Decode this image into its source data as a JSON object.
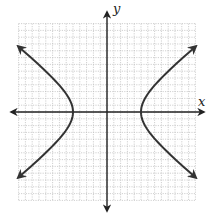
{
  "chart_data": {
    "type": "line",
    "title": "",
    "equation": "x^2/25 - y^2/16 = 1",
    "xlabel": "x",
    "ylabel": "y",
    "xlim": [
      -13,
      13
    ],
    "ylim": [
      -13,
      13
    ],
    "grid": true,
    "grid_style": "dotted light gray, 1 unit spacing",
    "tick_labels": false,
    "legend": null,
    "vertices": [
      [
        -5,
        0
      ],
      [
        5,
        0
      ]
    ],
    "series": [
      {
        "name": "right branch",
        "points": [
          [
            13,
            9.6
          ],
          [
            11,
            7.84
          ],
          [
            9,
            5.99
          ],
          [
            7,
            3.92
          ],
          [
            6,
            2.65
          ],
          [
            5.5,
            1.83
          ],
          [
            5,
            0
          ],
          [
            5.5,
            -1.83
          ],
          [
            6,
            -2.65
          ],
          [
            7,
            -3.92
          ],
          [
            9,
            -5.99
          ],
          [
            11,
            -7.84
          ],
          [
            13,
            -9.6
          ]
        ],
        "arrows": "both ends"
      },
      {
        "name": "left branch",
        "points": [
          [
            -13,
            9.6
          ],
          [
            -11,
            7.84
          ],
          [
            -9,
            5.99
          ],
          [
            -7,
            3.92
          ],
          [
            -6,
            2.65
          ],
          [
            -5.5,
            1.83
          ],
          [
            -5,
            0
          ],
          [
            -5.5,
            -1.83
          ],
          [
            -6,
            -2.65
          ],
          [
            -7,
            -3.92
          ],
          [
            -9,
            -5.99
          ],
          [
            -11,
            -7.84
          ],
          [
            -13,
            -9.6
          ]
        ],
        "arrows": "both ends"
      }
    ]
  },
  "labels": {
    "x_axis": "x",
    "y_axis": "y"
  },
  "colors": {
    "curve": "#333333",
    "axis": "#222222",
    "grid": "#bbbbbb"
  }
}
